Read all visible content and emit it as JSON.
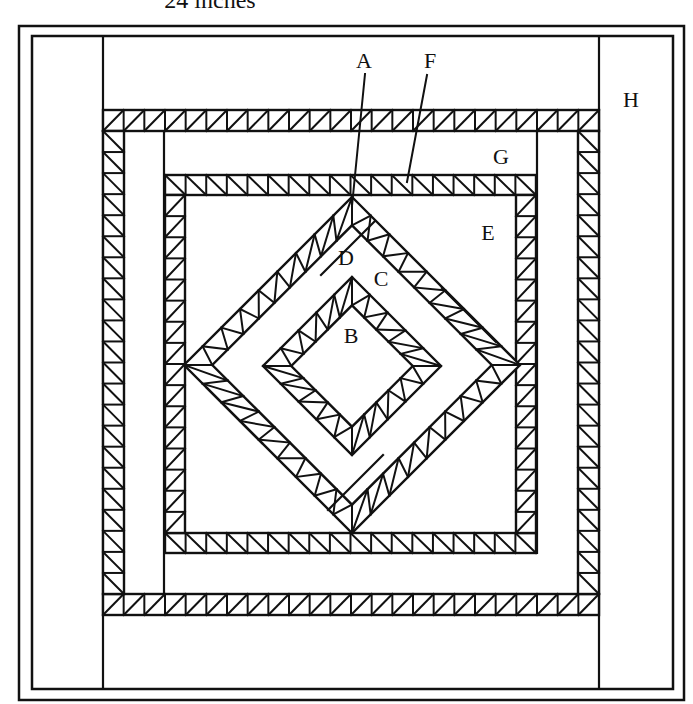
{
  "title": "24 inches",
  "colors": {
    "line": "#111111",
    "background": "#ffffff"
  },
  "labels": [
    {
      "id": "A",
      "text": "A",
      "x": 364,
      "y": 68
    },
    {
      "id": "F",
      "text": "F",
      "x": 430,
      "y": 68
    },
    {
      "id": "H",
      "text": "H",
      "x": 631,
      "y": 107
    },
    {
      "id": "G",
      "text": "G",
      "x": 501,
      "y": 164
    },
    {
      "id": "E",
      "text": "E",
      "x": 488,
      "y": 240
    },
    {
      "id": "D",
      "text": "D",
      "x": 346,
      "y": 265
    },
    {
      "id": "C",
      "text": "C",
      "x": 381,
      "y": 286
    },
    {
      "id": "B",
      "text": "B",
      "x": 351,
      "y": 343
    }
  ],
  "leaders": [
    {
      "id": "A",
      "x1": 365,
      "y1": 74,
      "x2": 352,
      "y2": 206
    },
    {
      "id": "F",
      "x1": 427,
      "y1": 75,
      "x2": 407,
      "y2": 182
    }
  ],
  "frames": {
    "outer": {
      "x": 19,
      "y": 26,
      "w": 665,
      "h": 674
    },
    "inner": {
      "x": 32,
      "y": 36,
      "w": 641,
      "h": 653
    }
  },
  "vertical_dividers": [
    {
      "x": 103,
      "y1": 36,
      "y2": 689
    },
    {
      "x": 599,
      "y1": 36,
      "y2": 689
    }
  ],
  "strip_lines": [
    {
      "x1": 164,
      "y1": 131,
      "x2": 164,
      "y2": 594
    },
    {
      "x1": 537,
      "y1": 131,
      "x2": 537,
      "y2": 553
    }
  ],
  "square_bands": [
    {
      "name": "outer-band",
      "x": 103,
      "y": 110,
      "w": 496,
      "h": 505,
      "t": 21,
      "cell": 21
    },
    {
      "name": "inner-band",
      "x": 165,
      "y": 175,
      "w": 371,
      "h": 378,
      "t": 20,
      "cell": 20.5
    }
  ],
  "diamonds": [
    {
      "name": "outer-diamond",
      "cx": 352,
      "cy": 365,
      "r": 168,
      "t": 20,
      "cells": 9
    },
    {
      "name": "inner-diamond",
      "cx": 352,
      "cy": 366,
      "r": 89,
      "t": 20,
      "cells": 5
    }
  ],
  "diamond_dividers": [
    {
      "x1": 375,
      "y1": 221,
      "x2": 321,
      "y2": 275
    },
    {
      "x1": 496,
      "y1": 342,
      "x2": 442,
      "y2": 288
    },
    {
      "x1": 328,
      "y1": 510,
      "x2": 383,
      "y2": 455
    },
    {
      "x1": 207,
      "y1": 388,
      "x2": 262,
      "y2": 443
    }
  ]
}
